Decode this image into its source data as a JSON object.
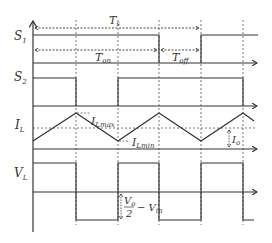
{
  "diagram": {
    "signals": [
      {
        "id": "S1",
        "label": "S",
        "sub": "1"
      },
      {
        "id": "S2",
        "label": "S",
        "sub": "2"
      },
      {
        "id": "IL",
        "label": "I",
        "sub": "L"
      },
      {
        "id": "VL",
        "label": "V",
        "sub": "L"
      }
    ],
    "annotations": {
      "ts": {
        "label": "T",
        "sub": "s"
      },
      "ton": {
        "label": "T",
        "sub": "on"
      },
      "toff": {
        "label": "T",
        "sub": "off"
      },
      "ilmax": {
        "label": "I",
        "sub": "Lmax"
      },
      "ilmin": {
        "label": "I",
        "sub": "Lmin"
      },
      "io": {
        "label": "I",
        "sub": "o"
      },
      "vl_low": {
        "num": "V",
        "num_sub": "o",
        "den": "2",
        "rest": "− V",
        "rest_sub": "in"
      }
    },
    "colors": {
      "line": "#333333",
      "dashed": "#555555",
      "background": "#ffffff"
    }
  }
}
